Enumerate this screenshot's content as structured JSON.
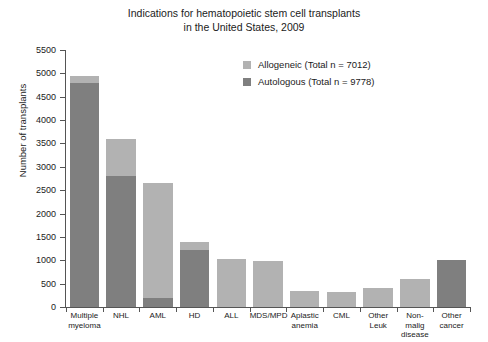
{
  "chart_data": {
    "type": "bar",
    "subtype": "stacked-vertical",
    "title": "Indications for hematopoietic stem cell transplants\nin the United States, 2009",
    "xlabel": "",
    "ylabel": "Number of transplants",
    "ylim": [
      0,
      5500
    ],
    "ytick_step": 500,
    "yticks": [
      0,
      500,
      1000,
      1500,
      2000,
      2500,
      3000,
      3500,
      4000,
      4500,
      5000,
      5500
    ],
    "ytick_labels": [
      "0",
      "500",
      "1000",
      "1500",
      "2000",
      "2500",
      "3000",
      "3500",
      "4000",
      "4500",
      "5000",
      "5500"
    ],
    "grid": false,
    "legend_position": "upper right inside",
    "categories": [
      "Multiple\nmyeloma",
      "NHL",
      "AML",
      "HD",
      "ALL",
      "MDS/MPD",
      "Aplastic\nanemia",
      "CML",
      "Other\nLeuk",
      "Non-\nmalig\ndisease",
      "Other\ncancer"
    ],
    "series": [
      {
        "name": "Autologous (Total n = 9778)",
        "short_name": "Autologous",
        "color": "#7f7f7f",
        "values": [
          4800,
          2800,
          200,
          1220,
          0,
          0,
          0,
          0,
          0,
          0,
          1000
        ]
      },
      {
        "name": "Allogeneic (Total n = 7012)",
        "short_name": "Allogeneic",
        "color": "#b2b2b2",
        "values": [
          150,
          800,
          2450,
          170,
          1020,
          985,
          350,
          320,
          400,
          600,
          0
        ]
      }
    ],
    "totals": [
      4950,
      3600,
      2650,
      1390,
      1020,
      985,
      350,
      320,
      400,
      600,
      1000
    ],
    "legend": [
      {
        "label": "Allogeneic (Total n = 7012)",
        "color": "#b2b2b2"
      },
      {
        "label": "Autologous (Total n = 9778)",
        "color": "#7f7f7f"
      }
    ]
  }
}
